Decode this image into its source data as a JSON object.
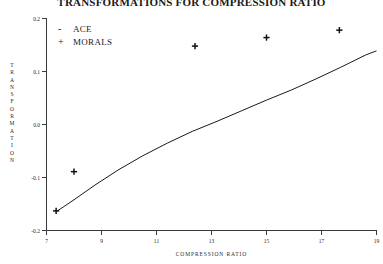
{
  "chart_data": {
    "type": "line",
    "title": "TRANSFORMATIONS FOR COMPRESSION RATIO",
    "xlabel": "COMPRESSION RATIO",
    "ylabel": "TRANSFORMATION",
    "xlim": [
      7,
      19
    ],
    "ylim": [
      -0.2,
      0.2
    ],
    "xticks": [
      7,
      9,
      11,
      13,
      15,
      17,
      19
    ],
    "xticklabels": [
      "7",
      "9",
      "11",
      "13",
      "15",
      "17",
      "19"
    ],
    "yticks": [
      -0.2,
      -0.1,
      0.0,
      0.1,
      0.2
    ],
    "yticklabels": [
      "-0.2",
      "-0.1",
      "0.0",
      "0.1",
      "0.2"
    ],
    "grid": false,
    "legend_position": "upper-left",
    "series": [
      {
        "name": "ACE",
        "marker": "line",
        "symbol": "-",
        "type": "line",
        "x": [
          7.4,
          8.0,
          8.8,
          9.6,
          10.5,
          11.4,
          12.3,
          13.2,
          14.1,
          15.0,
          15.9,
          16.8,
          17.7,
          18.6,
          19.0
        ],
        "y": [
          -0.163,
          -0.142,
          -0.113,
          -0.086,
          -0.059,
          -0.035,
          -0.013,
          0.006,
          0.026,
          0.046,
          0.065,
          0.086,
          0.108,
          0.131,
          0.139
        ]
      },
      {
        "name": "MORALS",
        "marker": "plus",
        "symbol": "+",
        "type": "scatter",
        "x": [
          7.35,
          8.0,
          12.4,
          15.0,
          17.65
        ],
        "y": [
          -0.163,
          -0.089,
          0.148,
          0.164,
          0.178
        ]
      }
    ],
    "legend": [
      {
        "symbol": "-",
        "label": "ACE"
      },
      {
        "symbol": "+",
        "label": "MORALS"
      }
    ],
    "ylabel_chars": [
      "T",
      "R",
      "A",
      "N",
      "S",
      "F",
      "O",
      "R",
      "M",
      "A",
      "T",
      "I",
      "O",
      "N"
    ]
  }
}
